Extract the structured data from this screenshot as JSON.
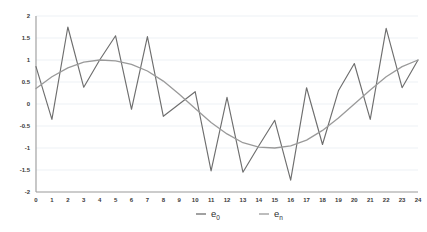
{
  "chart_data": {
    "type": "line",
    "title": "",
    "xlabel": "",
    "ylabel": "",
    "xlim": [
      0,
      24
    ],
    "ylim": [
      -2,
      2
    ],
    "grid": true,
    "legend_position": "bottom",
    "x": [
      0,
      1,
      2,
      3,
      4,
      5,
      6,
      7,
      8,
      9,
      10,
      11,
      12,
      13,
      14,
      15,
      16,
      17,
      18,
      19,
      20,
      21,
      22,
      23,
      24
    ],
    "xtick_labels": [
      "0",
      "1",
      "2",
      "3",
      "4",
      "5",
      "6",
      "7",
      "8",
      "9",
      "10",
      "11",
      "12",
      "13",
      "14",
      "15",
      "16",
      "17",
      "18",
      "19",
      "20",
      "21",
      "22",
      "23",
      "24"
    ],
    "ytick_labels": [
      "2",
      "1.5",
      "1",
      "0.5",
      "0",
      "-0.5",
      "-1",
      "-1.5",
      "-2"
    ],
    "ytick_values": [
      2,
      1.5,
      1,
      0.5,
      0,
      -0.5,
      -1,
      -1.5,
      -2
    ],
    "series": [
      {
        "name": "e₀",
        "legend_label": "e",
        "legend_subscript": "0",
        "color": "#6e6e6e",
        "values": [
          0.85,
          -0.35,
          1.75,
          0.38,
          1.0,
          1.55,
          -0.12,
          1.53,
          -0.28,
          0.0,
          0.28,
          -1.52,
          0.15,
          -1.55,
          -0.95,
          -0.37,
          -1.73,
          0.37,
          -0.92,
          0.3,
          0.92,
          -0.35,
          1.72,
          0.37,
          1.0
        ]
      },
      {
        "name": "eₙ",
        "legend_label": "e",
        "legend_subscript": "n",
        "color": "#9a9a9a",
        "values": [
          0.35,
          0.62,
          0.82,
          0.95,
          1.0,
          0.98,
          0.9,
          0.75,
          0.52,
          0.22,
          -0.1,
          -0.42,
          -0.68,
          -0.88,
          -0.98,
          -1.0,
          -0.95,
          -0.82,
          -0.6,
          -0.32,
          0.0,
          0.32,
          0.62,
          0.85,
          1.0
        ]
      }
    ]
  },
  "legend": {
    "items": [
      {
        "label": "e",
        "subscript": "0",
        "color": "#6e6e6e"
      },
      {
        "label": "e",
        "subscript": "n",
        "color": "#9a9a9a"
      }
    ]
  },
  "colors": {
    "grid": "#e9eef2",
    "axis": "#9a9a9a",
    "background": "#ffffff",
    "tick_text": "#3a3a3a"
  }
}
